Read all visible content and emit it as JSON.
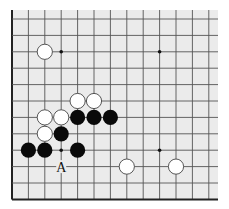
{
  "diagram": {
    "type": "go-board-fragment",
    "colors": {
      "page_background": "#ffffff",
      "board_background": "#ebebeb",
      "grid_line": "#555555",
      "edge_line": "#222222",
      "black_stone": "#0a0a0a",
      "white_stone": "#ffffff",
      "white_stone_outline": "#444444"
    },
    "grid": {
      "origin_x": 12,
      "origin_y": 19,
      "spacing": 16.4,
      "columns": 13,
      "rows": 12,
      "left_edge": true,
      "bottom_edge": true,
      "top_edge": false,
      "right_edge": false,
      "board_area": {
        "x": 12,
        "y": 10,
        "right": 218,
        "bottom": 199
      }
    },
    "star_points": [
      {
        "col": 3,
        "row": 2
      },
      {
        "col": 9,
        "row": 2
      },
      {
        "col": 3,
        "row": 8
      },
      {
        "col": 9,
        "row": 8
      }
    ],
    "stones": [
      {
        "color": "white",
        "col": 2,
        "row": 2
      },
      {
        "color": "white",
        "col": 4,
        "row": 5
      },
      {
        "color": "white",
        "col": 5,
        "row": 5
      },
      {
        "color": "white",
        "col": 2,
        "row": 6
      },
      {
        "color": "white",
        "col": 3,
        "row": 6
      },
      {
        "color": "black",
        "col": 4,
        "row": 6
      },
      {
        "color": "black",
        "col": 5,
        "row": 6
      },
      {
        "color": "black",
        "col": 6,
        "row": 6
      },
      {
        "color": "white",
        "col": 2,
        "row": 7
      },
      {
        "color": "black",
        "col": 3,
        "row": 7
      },
      {
        "color": "black",
        "col": 1,
        "row": 8
      },
      {
        "color": "black",
        "col": 2,
        "row": 8
      },
      {
        "color": "black",
        "col": 4,
        "row": 8
      },
      {
        "color": "white",
        "col": 7,
        "row": 9
      },
      {
        "color": "white",
        "col": 10,
        "row": 9
      }
    ],
    "labels": [
      {
        "text": "A",
        "col": 3,
        "row": 9
      }
    ]
  }
}
